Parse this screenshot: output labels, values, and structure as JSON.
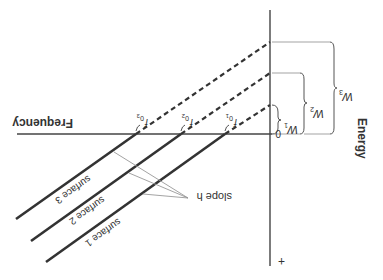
{
  "figure": {
    "orientation": "rotated-180",
    "axes": {
      "x_label": "Frequency",
      "y_label": "Energy",
      "origin_label": "0",
      "positive_marker": "+"
    },
    "intercepts": [
      {
        "id": "f01",
        "label": "f",
        "sub": "0",
        "subsub": "1"
      },
      {
        "id": "f02",
        "label": "f",
        "sub": "0",
        "subsub": "2"
      },
      {
        "id": "f03",
        "label": "f",
        "sub": "0",
        "subsub": "3"
      }
    ],
    "surfaces": [
      {
        "label": "surface 1"
      },
      {
        "label": "surface 2"
      },
      {
        "label": "surface 3"
      }
    ],
    "slope_label": "slope h",
    "work_functions": [
      {
        "label": "W",
        "sub": "1"
      },
      {
        "label": "W",
        "sub": "2"
      },
      {
        "label": "W",
        "sub": "3"
      }
    ],
    "colors": {
      "line": "#333333",
      "leader": "#999999",
      "background": "#ffffff"
    }
  }
}
